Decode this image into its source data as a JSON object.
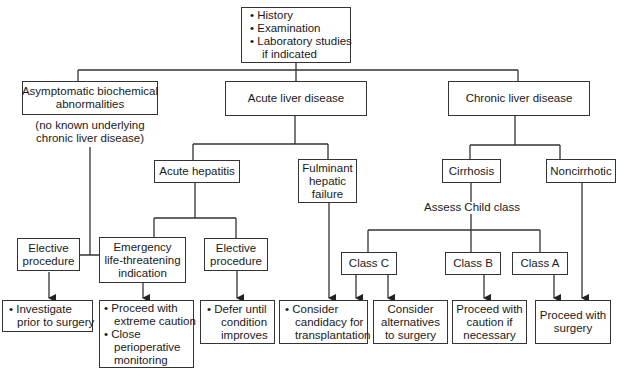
{
  "diagram": {
    "top": {
      "items": [
        "History",
        "Examination",
        "Laboratory studies",
        "if indicated"
      ]
    },
    "level1": {
      "asymptomatic": {
        "lines": [
          "Asymptomatic biochemical",
          "abnormalities"
        ],
        "note": [
          "(no known underlying",
          "chronic liver disease)"
        ]
      },
      "acute": {
        "label": "Acute liver disease"
      },
      "chronic": {
        "label": "Chronic liver disease"
      }
    },
    "level2": {
      "acute_hepatitis": {
        "label": "Acute hepatitis"
      },
      "fulminant": {
        "lines": [
          "Fulminant",
          "hepatic",
          "failure"
        ]
      },
      "cirrhosis": {
        "label": "Cirrhosis"
      },
      "noncirrhotic": {
        "label": "Noncirrhotic"
      },
      "assess_note": "Assess Child class"
    },
    "level3": {
      "elective1": {
        "lines": [
          "Elective",
          "procedure"
        ]
      },
      "emergency": {
        "lines": [
          "Emergency",
          "life-threatening",
          "indication"
        ]
      },
      "elective2": {
        "lines": [
          "Elective",
          "procedure"
        ]
      },
      "class_c": {
        "label": "Class C"
      },
      "class_b": {
        "label": "Class B"
      },
      "class_a": {
        "label": "Class A"
      }
    },
    "outcomes": {
      "investigate": {
        "lines": [
          "Investigate",
          "prior to surgery"
        ]
      },
      "proceed_caution": {
        "item1": [
          "Proceed with",
          "extreme caution"
        ],
        "item2": [
          "Close",
          "perioperative",
          "monitoring"
        ]
      },
      "defer": {
        "lines": [
          "Defer until",
          "condition",
          "improves"
        ]
      },
      "candidacy": {
        "lines": [
          "Consider",
          "candidacy for",
          "transplantation"
        ]
      },
      "alternatives": {
        "lines": [
          "Consider",
          "alternatives",
          "to surgery"
        ]
      },
      "caution_if": {
        "lines": [
          "Proceed with",
          "caution if",
          "necessary"
        ]
      },
      "proceed_surgery": {
        "lines": [
          "Proceed with",
          "surgery"
        ]
      }
    },
    "bullet": "•"
  }
}
